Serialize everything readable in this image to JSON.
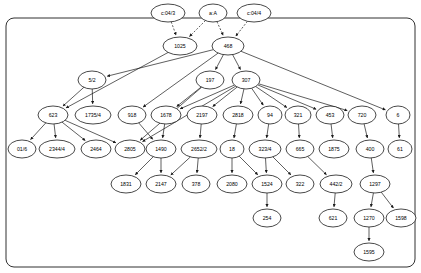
{
  "figure": {
    "kind": "directed-acyclic-graph",
    "width": 421,
    "height": 273,
    "background_color": "#ffffff",
    "stroke_color": "#1a1a1a",
    "node_fill_color": "#ffffff",
    "frame": {
      "x": 6,
      "y": 18,
      "width": 409,
      "height": 249,
      "rounded": true
    }
  },
  "chart_data": {
    "type": "diagram",
    "title": "",
    "nodes": [
      {
        "id": "c:04/3",
        "label": "c:04/3",
        "x": 168,
        "y": 13,
        "rx": 17,
        "ry": 9,
        "outside_frame": true
      },
      {
        "id": "a:A",
        "label": "a:A",
        "x": 213,
        "y": 13,
        "rx": 14,
        "ry": 9,
        "outside_frame": true
      },
      {
        "id": "c:04/4",
        "label": "c:04/4",
        "x": 254,
        "y": 13,
        "rx": 17,
        "ry": 9,
        "outside_frame": true
      },
      {
        "id": "1025",
        "label": "1025",
        "x": 180,
        "y": 46,
        "rx": 17,
        "ry": 9
      },
      {
        "id": "468",
        "label": "468",
        "x": 228,
        "y": 46,
        "rx": 16,
        "ry": 9
      },
      {
        "id": "5/2",
        "label": "5/2",
        "x": 92,
        "y": 80,
        "rx": 14,
        "ry": 9
      },
      {
        "id": "197",
        "label": "197",
        "x": 210,
        "y": 80,
        "rx": 14,
        "ry": 9
      },
      {
        "id": "307",
        "label": "307",
        "x": 246,
        "y": 80,
        "rx": 14,
        "ry": 9
      },
      {
        "id": "623",
        "label": "623",
        "x": 53,
        "y": 115,
        "rx": 15,
        "ry": 9
      },
      {
        "id": "1735/4",
        "label": "1735/4",
        "x": 93,
        "y": 115,
        "rx": 18,
        "ry": 9
      },
      {
        "id": "918",
        "label": "918",
        "x": 132,
        "y": 115,
        "rx": 14,
        "ry": 9
      },
      {
        "id": "1678",
        "label": "1678",
        "x": 166,
        "y": 115,
        "rx": 15,
        "ry": 9
      },
      {
        "id": "2197",
        "label": "2197",
        "x": 202,
        "y": 115,
        "rx": 15,
        "ry": 9
      },
      {
        "id": "2818",
        "label": "2818",
        "x": 238,
        "y": 115,
        "rx": 15,
        "ry": 9
      },
      {
        "id": "94",
        "label": "94",
        "x": 270,
        "y": 115,
        "rx": 12,
        "ry": 9
      },
      {
        "id": "321",
        "label": "321",
        "x": 298,
        "y": 115,
        "rx": 13,
        "ry": 9
      },
      {
        "id": "453",
        "label": "453",
        "x": 330,
        "y": 115,
        "rx": 14,
        "ry": 9
      },
      {
        "id": "720",
        "label": "720",
        "x": 362,
        "y": 115,
        "rx": 14,
        "ry": 9
      },
      {
        "id": "6",
        "label": "6",
        "x": 398,
        "y": 115,
        "rx": 12,
        "ry": 9
      },
      {
        "id": "01/6",
        "label": "01/6",
        "x": 22,
        "y": 149,
        "rx": 14,
        "ry": 9
      },
      {
        "id": "2344/4",
        "label": "2344/4",
        "x": 57,
        "y": 149,
        "rx": 18,
        "ry": 9
      },
      {
        "id": "2464",
        "label": "2464",
        "x": 96,
        "y": 149,
        "rx": 15,
        "ry": 9
      },
      {
        "id": "2805",
        "label": "2805",
        "x": 130,
        "y": 149,
        "rx": 15,
        "ry": 9
      },
      {
        "id": "1490",
        "label": "1490",
        "x": 161,
        "y": 149,
        "rx": 15,
        "ry": 9
      },
      {
        "id": "2652/2",
        "label": "2652/2",
        "x": 199,
        "y": 149,
        "rx": 18,
        "ry": 9
      },
      {
        "id": "18",
        "label": "18",
        "x": 232,
        "y": 149,
        "rx": 12,
        "ry": 9
      },
      {
        "id": "323/4",
        "label": "323/4",
        "x": 265,
        "y": 149,
        "rx": 16,
        "ry": 9
      },
      {
        "id": "665",
        "label": "665",
        "x": 300,
        "y": 149,
        "rx": 14,
        "ry": 9
      },
      {
        "id": "1875",
        "label": "1875",
        "x": 334,
        "y": 149,
        "rx": 15,
        "ry": 9
      },
      {
        "id": "400",
        "label": "400",
        "x": 370,
        "y": 149,
        "rx": 14,
        "ry": 9
      },
      {
        "id": "61",
        "label": "61",
        "x": 400,
        "y": 149,
        "rx": 12,
        "ry": 9
      },
      {
        "id": "1831",
        "label": "1831",
        "x": 126,
        "y": 184,
        "rx": 15,
        "ry": 9
      },
      {
        "id": "2147",
        "label": "2147",
        "x": 161,
        "y": 184,
        "rx": 15,
        "ry": 9
      },
      {
        "id": "378",
        "label": "378",
        "x": 196,
        "y": 184,
        "rx": 14,
        "ry": 9
      },
      {
        "id": "2080",
        "label": "2080",
        "x": 232,
        "y": 184,
        "rx": 15,
        "ry": 9
      },
      {
        "id": "1524",
        "label": "1524",
        "x": 267,
        "y": 184,
        "rx": 15,
        "ry": 9
      },
      {
        "id": "322",
        "label": "322",
        "x": 300,
        "y": 184,
        "rx": 14,
        "ry": 9
      },
      {
        "id": "442/2",
        "label": "442/2",
        "x": 336,
        "y": 184,
        "rx": 16,
        "ry": 9
      },
      {
        "id": "1297",
        "label": "1297",
        "x": 375,
        "y": 184,
        "rx": 15,
        "ry": 9
      },
      {
        "id": "254",
        "label": "254",
        "x": 267,
        "y": 218,
        "rx": 14,
        "ry": 9
      },
      {
        "id": "621",
        "label": "621",
        "x": 333,
        "y": 218,
        "rx": 14,
        "ry": 9
      },
      {
        "id": "1270",
        "label": "1270",
        "x": 369,
        "y": 218,
        "rx": 15,
        "ry": 9
      },
      {
        "id": "1598",
        "label": "1598",
        "x": 401,
        "y": 218,
        "rx": 15,
        "ry": 9
      },
      {
        "id": "1595",
        "label": "1595",
        "x": 369,
        "y": 252,
        "rx": 15,
        "ry": 9
      }
    ],
    "edges": [
      {
        "from": "c:04/3",
        "to": "1025",
        "style": "dashed"
      },
      {
        "from": "a:A",
        "to": "1025",
        "style": "dashed"
      },
      {
        "from": "a:A",
        "to": "468",
        "style": "dashed"
      },
      {
        "from": "c:04/4",
        "to": "468",
        "style": "dashed"
      },
      {
        "from": "1025",
        "to": "623",
        "style": "solid"
      },
      {
        "from": "468",
        "to": "5/2",
        "style": "solid"
      },
      {
        "from": "468",
        "to": "197",
        "style": "solid"
      },
      {
        "from": "468",
        "to": "307",
        "style": "solid"
      },
      {
        "from": "468",
        "to": "6",
        "style": "solid"
      },
      {
        "from": "468",
        "to": "918",
        "style": "solid"
      },
      {
        "from": "5/2",
        "to": "623",
        "style": "solid"
      },
      {
        "from": "5/2",
        "to": "1735/4",
        "style": "solid"
      },
      {
        "from": "197",
        "to": "1678",
        "style": "solid"
      },
      {
        "from": "197",
        "to": "2805",
        "style": "solid"
      },
      {
        "from": "307",
        "to": "1678",
        "style": "solid"
      },
      {
        "from": "307",
        "to": "2197",
        "style": "solid"
      },
      {
        "from": "307",
        "to": "2818",
        "style": "solid"
      },
      {
        "from": "307",
        "to": "94",
        "style": "solid"
      },
      {
        "from": "307",
        "to": "321",
        "style": "solid"
      },
      {
        "from": "307",
        "to": "453",
        "style": "solid"
      },
      {
        "from": "307",
        "to": "720",
        "style": "solid"
      },
      {
        "from": "307",
        "to": "2805",
        "style": "solid"
      },
      {
        "from": "623",
        "to": "01/6",
        "style": "solid"
      },
      {
        "from": "623",
        "to": "2344/4",
        "style": "solid"
      },
      {
        "from": "623",
        "to": "2464",
        "style": "solid"
      },
      {
        "from": "623",
        "to": "2805",
        "style": "solid"
      },
      {
        "from": "918",
        "to": "1490",
        "style": "solid"
      },
      {
        "from": "1678",
        "to": "1490",
        "style": "solid"
      },
      {
        "from": "2197",
        "to": "2652/2",
        "style": "solid"
      },
      {
        "from": "2818",
        "to": "18",
        "style": "solid"
      },
      {
        "from": "94",
        "to": "323/4",
        "style": "solid"
      },
      {
        "from": "321",
        "to": "665",
        "style": "solid"
      },
      {
        "from": "453",
        "to": "1875",
        "style": "solid"
      },
      {
        "from": "720",
        "to": "400",
        "style": "solid"
      },
      {
        "from": "6",
        "to": "61",
        "style": "solid"
      },
      {
        "from": "1490",
        "to": "1831",
        "style": "solid"
      },
      {
        "from": "1490",
        "to": "2147",
        "style": "solid"
      },
      {
        "from": "2652/2",
        "to": "2147",
        "style": "solid"
      },
      {
        "from": "2652/2",
        "to": "378",
        "style": "solid"
      },
      {
        "from": "18",
        "to": "2080",
        "style": "solid"
      },
      {
        "from": "18",
        "to": "1524",
        "style": "solid"
      },
      {
        "from": "323/4",
        "to": "1524",
        "style": "solid"
      },
      {
        "from": "323/4",
        "to": "322",
        "style": "solid"
      },
      {
        "from": "665",
        "to": "442/2",
        "style": "solid"
      },
      {
        "from": "400",
        "to": "1297",
        "style": "solid"
      },
      {
        "from": "1524",
        "to": "254",
        "style": "solid"
      },
      {
        "from": "442/2",
        "to": "621",
        "style": "solid"
      },
      {
        "from": "1297",
        "to": "1270",
        "style": "solid"
      },
      {
        "from": "1297",
        "to": "1598",
        "style": "solid"
      },
      {
        "from": "1270",
        "to": "1595",
        "style": "solid"
      }
    ]
  }
}
